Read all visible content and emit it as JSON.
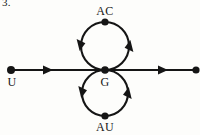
{
  "figure": {
    "item_number": "3.",
    "background_color": "#fdfdfb",
    "ink_color": "#151515",
    "labels": {
      "top_node": "AC",
      "center_node": "G",
      "bottom_node": "AU",
      "left_node": "U"
    },
    "nodes": [
      {
        "id": "left-endpoint",
        "label": "U",
        "x": 11,
        "y": 70,
        "marker": "filled-dot"
      },
      {
        "id": "center-junction",
        "label": "G",
        "x": 105,
        "y": 70,
        "marker": "filled-dot"
      },
      {
        "id": "top-node",
        "label": "AC",
        "x": 105,
        "y": 22,
        "marker": "filled-dot"
      },
      {
        "id": "bottom-node",
        "label": "AU",
        "x": 105,
        "y": 116,
        "marker": "filled-dot"
      },
      {
        "id": "right-endpoint",
        "label": "",
        "x": 196,
        "y": 70,
        "marker": "filled-dot"
      }
    ],
    "edges": [
      {
        "id": "line-left",
        "type": "line",
        "from": "left-endpoint",
        "to": "center-junction",
        "arrow_direction": "right"
      },
      {
        "id": "line-right",
        "type": "line",
        "from": "center-junction",
        "to": "right-endpoint",
        "arrow_direction": "right"
      },
      {
        "id": "loop-upper",
        "type": "circle",
        "cx": 105,
        "cy": 46,
        "r": 24,
        "orientation": "counterclockwise"
      },
      {
        "id": "loop-lower",
        "type": "circle",
        "cx": 105,
        "cy": 93,
        "r": 23,
        "orientation": "counterclockwise"
      }
    ]
  }
}
